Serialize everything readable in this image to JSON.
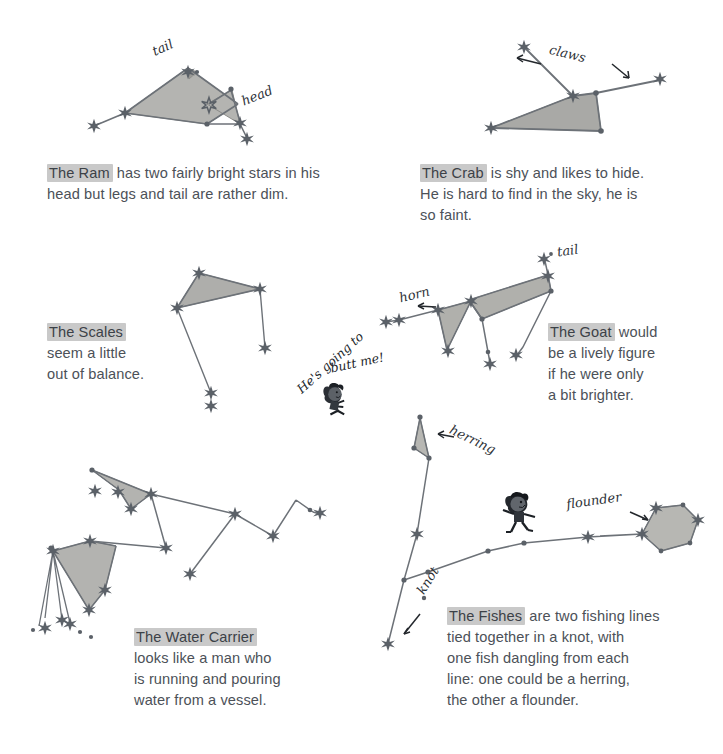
{
  "page": {
    "background_color": "#ffffff",
    "ink_color": "#4a4f56",
    "highlight_color": "#c9c9c9",
    "star_fill_color": "#595f66",
    "shape_fill_color": "#b9b9b6"
  },
  "captions": [
    {
      "id": "ram",
      "name": "The Ram",
      "rest": " has two fairly bright stars in his",
      "lines": [
        "head but legs and tail are rather dim."
      ]
    },
    {
      "id": "crab",
      "name": "The Crab",
      "rest": " is shy and likes to hide.",
      "lines": [
        "He is hard to find in the sky, he is",
        "so faint."
      ]
    },
    {
      "id": "scales",
      "name": "The Scales",
      "rest": "",
      "lines": [
        "seem a little",
        "out of balance."
      ]
    },
    {
      "id": "goat",
      "name": "The Goat",
      "rest": " would",
      "lines": [
        "be a lively figure",
        "if he were only",
        "a bit brighter."
      ]
    },
    {
      "id": "water-carrier",
      "name": "The Water Carrier",
      "rest": "",
      "lines": [
        "looks like a man who",
        "is running and pouring",
        "water from a vessel."
      ]
    },
    {
      "id": "fishes",
      "name": "The Fishes",
      "rest": " are two fishing lines",
      "lines": [
        "tied together in a knot, with",
        "one fish dangling from each",
        "line: one could be a herring,",
        "the other a flounder."
      ]
    }
  ],
  "annotations": {
    "ram_tail": "tail",
    "ram_head": "head",
    "crab_claws": "claws",
    "goat_horn": "horn",
    "goat_tail": "tail",
    "fishes_herring": "herring",
    "fishes_knot": "knot",
    "fishes_flounder": "flounder"
  },
  "speech": {
    "butt_me_part1": "He's going to",
    "butt_me_part2": "butt me!"
  },
  "figures": [
    {
      "id": "boy-fleeing-goat",
      "label": "cartoon-boy-running"
    },
    {
      "id": "boy-running-fishes",
      "label": "cartoon-boy-running"
    }
  ]
}
